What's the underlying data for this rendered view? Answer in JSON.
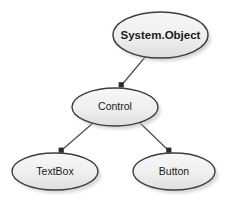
{
  "diagram": {
    "background_color": "#ffffff",
    "node_fill_top": "#f5f5f5",
    "node_fill_bottom": "#e2e2e2",
    "node_border_color": "#3d3d3d",
    "edge_color": "#4a4a4a",
    "arrow_color": "#2b2b2b",
    "shadow_color": "#b9b9b9",
    "text_color": "#1a1a1a",
    "nodes": [
      {
        "id": "system-object",
        "label": "System.Object",
        "bold": true,
        "cx": 160.5,
        "cy": 35,
        "rx": 47.5,
        "ry": 23
      },
      {
        "id": "control",
        "label": "Control",
        "bold": false,
        "cx": 115,
        "cy": 107,
        "rx": 43,
        "ry": 19
      },
      {
        "id": "textbox",
        "label": "TextBox",
        "bold": false,
        "cx": 55,
        "cy": 171.5,
        "rx": 43,
        "ry": 18.5
      },
      {
        "id": "button",
        "label": "Button",
        "bold": false,
        "cx": 174,
        "cy": 171.5,
        "rx": 41,
        "ry": 18.5
      }
    ],
    "edges": [
      {
        "id": "edge-object-control",
        "from": "system-object",
        "to": "control",
        "x1": 146,
        "y1": 56,
        "x2": 121,
        "y2": 86
      },
      {
        "id": "edge-control-textbox",
        "from": "control",
        "to": "textbox",
        "x1": 93,
        "y1": 123,
        "x2": 61,
        "y2": 151
      },
      {
        "id": "edge-control-button",
        "from": "control",
        "to": "button",
        "x1": 140,
        "y1": 123,
        "x2": 169,
        "y2": 151
      }
    ]
  }
}
